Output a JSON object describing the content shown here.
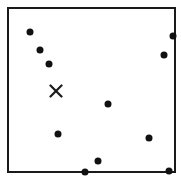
{
  "figure": {
    "width": 182,
    "height": 186,
    "background_color": "#ffffff"
  },
  "plot_frame": {
    "left": 7,
    "top": 7,
    "width": 169,
    "height": 166,
    "border_width": 2,
    "border_color": "#1a1a1a",
    "fill_color": "#ffffff"
  },
  "chart_data": {
    "type": "scatter",
    "title": "",
    "subtitle": "",
    "xlabel": "",
    "ylabel": "",
    "xlim": [
      0,
      169
    ],
    "ylim": [
      0,
      166
    ],
    "grid": false,
    "legend": null,
    "axis_ticks": {
      "x": [],
      "y": []
    },
    "annotations": [],
    "series": [
      {
        "name": "points",
        "marker": "filled-circle",
        "marker_color": "#111111",
        "marker_size": 7,
        "count": 11,
        "points": [
          {
            "id": "p1",
            "x": 21,
            "y": 23
          },
          {
            "id": "p2",
            "x": 31,
            "y": 41
          },
          {
            "id": "p3",
            "x": 40,
            "y": 55
          },
          {
            "id": "p4",
            "x": 164,
            "y": 27
          },
          {
            "id": "p5",
            "x": 155,
            "y": 46
          },
          {
            "id": "p6",
            "x": 99,
            "y": 95
          },
          {
            "id": "p7",
            "x": 49,
            "y": 125
          },
          {
            "id": "p8",
            "x": 140,
            "y": 129
          },
          {
            "id": "p9",
            "x": 89,
            "y": 152
          },
          {
            "id": "p10",
            "x": 76,
            "y": 163
          },
          {
            "id": "p11",
            "x": 160,
            "y": 162
          }
        ]
      },
      {
        "name": "marker",
        "marker": "x-cross",
        "marker_color": "#1a1a1a",
        "marker_size": 14,
        "stroke_width": 2.2,
        "count": 1,
        "points": [
          {
            "id": "x1",
            "x": 47,
            "y": 82
          }
        ]
      }
    ]
  }
}
